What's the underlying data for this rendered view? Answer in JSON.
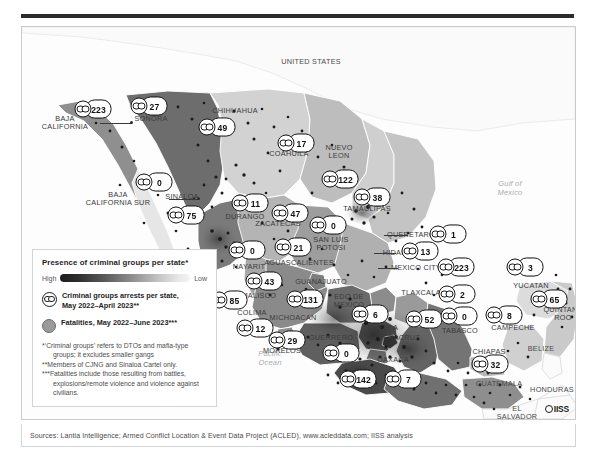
{
  "figure": {
    "ocean_labels": [
      {
        "name": "gulf-of-mexico",
        "text": "Gulf of\nMexico",
        "x": 487,
        "y": 185
      },
      {
        "name": "pacific-ocean",
        "text": "Pacific\nOcean",
        "x": 248,
        "y": 355
      }
    ],
    "geo_labels": [
      {
        "name": "united-states",
        "text": "UNITED STATES",
        "x": 310,
        "y": 61,
        "cls": "country"
      },
      {
        "name": "baja-california",
        "text": "BAJA\nCALIFORNIA",
        "x": 64,
        "y": 122
      },
      {
        "name": "baja-california-sur",
        "text": "BAJA\nCALIFORNIA SUR",
        "x": 117,
        "y": 198
      },
      {
        "name": "sonora",
        "text": "SONORA",
        "x": 150,
        "y": 118
      },
      {
        "name": "chihuahua",
        "text": "CHIHUAHUA",
        "x": 234,
        "y": 110
      },
      {
        "name": "coahuila",
        "text": "COAHUILA",
        "x": 288,
        "y": 153
      },
      {
        "name": "nuevo-leon",
        "text": "NUEVO\nLEON",
        "x": 338,
        "y": 151
      },
      {
        "name": "tamaulipas",
        "text": "TAMAULIPAS",
        "x": 366,
        "y": 208
      },
      {
        "name": "sinaloa",
        "text": "SINALOA",
        "x": 181,
        "y": 196
      },
      {
        "name": "durango",
        "text": "DURANGO",
        "x": 244,
        "y": 216
      },
      {
        "name": "zacatecas",
        "text": "ZACATECAS",
        "x": 277,
        "y": 223
      },
      {
        "name": "san-luis-potosi",
        "text": "SAN LUIS\nPOTOSI",
        "x": 330,
        "y": 243
      },
      {
        "name": "nayarit",
        "text": "NAYARIT",
        "x": 248,
        "y": 266
      },
      {
        "name": "aguascalientes",
        "text": "AGUASCALIENTES",
        "x": 298,
        "y": 262
      },
      {
        "name": "guanajuato",
        "text": "GUANAJUATO",
        "x": 320,
        "y": 281
      },
      {
        "name": "jalisco",
        "text": "JALISCO",
        "x": 259,
        "y": 295
      },
      {
        "name": "colima",
        "text": "COLIMA",
        "x": 251,
        "y": 312
      },
      {
        "name": "michoacan",
        "text": "MICHOACAN",
        "x": 292,
        "y": 317
      },
      {
        "name": "estado-de-mexico",
        "text": "EDO DE\nMEXICO",
        "x": 348,
        "y": 300
      },
      {
        "name": "morelos",
        "text": "MORELOS",
        "x": 281,
        "y": 350
      },
      {
        "name": "guerrero",
        "text": "GUERRERO",
        "x": 330,
        "y": 337
      },
      {
        "name": "queretaro",
        "text": "QUERETARO",
        "x": 410,
        "y": 234
      },
      {
        "name": "hidalgo",
        "text": "HIDALGO",
        "x": 399,
        "y": 252
      },
      {
        "name": "mexico-city",
        "text": "MEXICO CITY",
        "x": 415,
        "y": 267
      },
      {
        "name": "tlaxcala",
        "text": "TLAXCALA",
        "x": 420,
        "y": 292
      },
      {
        "name": "puebla",
        "text": "PUEBLA",
        "x": 382,
        "y": 327
      },
      {
        "name": "veracruz",
        "text": "VERACRUZ",
        "x": 398,
        "y": 337
      },
      {
        "name": "oaxaca",
        "text": "OAXACA",
        "x": 392,
        "y": 359
      },
      {
        "name": "tabasco",
        "text": "TABASCO",
        "x": 459,
        "y": 330
      },
      {
        "name": "campeche",
        "text": "CAMPECHE",
        "x": 512,
        "y": 327
      },
      {
        "name": "yucatan",
        "text": "YUCATAN",
        "x": 530,
        "y": 285
      },
      {
        "name": "quintana-roo",
        "text": "QUINTANA\nROO",
        "x": 562,
        "y": 313
      },
      {
        "name": "chiapas",
        "text": "CHIAPAS",
        "x": 488,
        "y": 351
      },
      {
        "name": "belize",
        "text": "BELIZE",
        "x": 540,
        "y": 348,
        "cls": "country"
      },
      {
        "name": "guatemala",
        "text": "GUATEMALA",
        "x": 498,
        "y": 383,
        "cls": "country"
      },
      {
        "name": "honduras",
        "text": "HONDURAS",
        "x": 551,
        "y": 389,
        "cls": "country"
      },
      {
        "name": "el-salvador",
        "text": "EL\nSALVADOR",
        "x": 516,
        "y": 412,
        "cls": "country"
      }
    ],
    "markers": [
      {
        "name": "marker-baja-california",
        "state": "Baja California",
        "value": "223",
        "x": 92,
        "y": 108
      },
      {
        "name": "marker-sonora",
        "state": "Sonora",
        "value": "27",
        "x": 148,
        "y": 105
      },
      {
        "name": "marker-chihuahua",
        "state": "Chihuahua",
        "value": "49",
        "x": 216,
        "y": 126
      },
      {
        "name": "marker-coahuila",
        "state": "Coahuila",
        "value": "17",
        "x": 295,
        "y": 142
      },
      {
        "name": "marker-nuevo-leon",
        "state": "Nuevo Leon",
        "value": "122",
        "x": 339,
        "y": 178
      },
      {
        "name": "marker-tamaulipas",
        "state": "Tamaulipas",
        "value": "38",
        "x": 371,
        "y": 196
      },
      {
        "name": "marker-baja-california-sur",
        "state": "Baja California Sur",
        "value": "0",
        "x": 153,
        "y": 181
      },
      {
        "name": "marker-sinaloa",
        "state": "Sinaloa",
        "value": "75",
        "x": 185,
        "y": 214
      },
      {
        "name": "marker-durango",
        "state": "Durango",
        "value": "11",
        "x": 249,
        "y": 202
      },
      {
        "name": "marker-zacatecas",
        "state": "Zacatecas",
        "value": "47",
        "x": 289,
        "y": 212
      },
      {
        "name": "marker-san-luis-potosi",
        "state": "San Luis Potosi",
        "value": "0",
        "x": 327,
        "y": 224
      },
      {
        "name": "marker-nayarit",
        "state": "Nayarit",
        "value": "0",
        "x": 246,
        "y": 249
      },
      {
        "name": "marker-slp-second",
        "state": "Zacatecas south",
        "value": "21",
        "x": 292,
        "y": 246
      },
      {
        "name": "marker-aguascalientes",
        "state": "Aguascalientes",
        "value": "43",
        "x": 263,
        "y": 280
      },
      {
        "name": "marker-jalisco",
        "state": "Jalisco",
        "value": "85",
        "x": 228,
        "y": 299
      },
      {
        "name": "marker-guanajuato",
        "state": "Guanajuato",
        "value": "131",
        "x": 304,
        "y": 298
      },
      {
        "name": "marker-colima",
        "state": "Colima",
        "value": "12",
        "x": 254,
        "y": 327
      },
      {
        "name": "marker-morelos",
        "state": "Morelos",
        "value": "29",
        "x": 286,
        "y": 339
      },
      {
        "name": "marker-guerrero",
        "state": "Guerrero",
        "value": "0",
        "x": 340,
        "y": 352
      },
      {
        "name": "marker-oaxaca-south",
        "state": "Oaxaca south",
        "value": "142",
        "x": 357,
        "y": 378
      },
      {
        "name": "marker-oaxaca",
        "state": "Oaxaca",
        "value": "7",
        "x": 402,
        "y": 378
      },
      {
        "name": "marker-queretaro",
        "state": "Queretaro",
        "value": "1",
        "x": 447,
        "y": 233
      },
      {
        "name": "marker-hidalgo",
        "state": "Hidalgo",
        "value": "13",
        "x": 419,
        "y": 250
      },
      {
        "name": "marker-mexico-city",
        "state": "Mexico City",
        "value": "223",
        "x": 455,
        "y": 266
      },
      {
        "name": "marker-tlaxcala",
        "state": "Tlaxcala",
        "value": "2",
        "x": 456,
        "y": 293
      },
      {
        "name": "marker-puebla",
        "state": "Puebla",
        "value": "6",
        "x": 369,
        "y": 313
      },
      {
        "name": "marker-veracruz",
        "state": "Veracruz",
        "value": "52",
        "x": 423,
        "y": 318
      },
      {
        "name": "marker-tabasco",
        "state": "Tabasco",
        "value": "0",
        "x": 458,
        "y": 315
      },
      {
        "name": "marker-campeche",
        "state": "Campeche",
        "value": "8",
        "x": 503,
        "y": 314
      },
      {
        "name": "marker-yucatan",
        "state": "Yucatan",
        "value": "3",
        "x": 524,
        "y": 266
      },
      {
        "name": "marker-quintana-roo",
        "state": "Quintana Roo",
        "value": "65",
        "x": 548,
        "y": 298
      },
      {
        "name": "marker-chiapas",
        "state": "Chiapas",
        "value": "32",
        "x": 489,
        "y": 363
      }
    ]
  },
  "legend": {
    "title": "Presence of criminal groups per state*",
    "ramp_high": "High",
    "ramp_low": "Low",
    "arrests_label": "Criminal groups arrests per state,\nMay 2022–April 2023**",
    "fatalities_label": "Fatalities, May 2022–June 2023***",
    "footnote_1": "*‘Criminal groups’ refers to DTOs and mafia-type groups; it excludes smaller gangs",
    "footnote_2": "**Members of CJNG and Sinaloa Cartel only.",
    "footnote_3": "***Fatalities include those resulting from battles, explosions/remote violence and violence against civilians."
  },
  "sources": {
    "text": "Sources: Lantia Intelligence; Armed Conflict Location & Event Data Project (ACLED), www.acleddata.com; IISS analysis"
  },
  "branding": {
    "logo_text": "IISS"
  },
  "colors": {
    "ramp_dark": "#1c1c1c",
    "ramp_light": "#f4f4f4",
    "fatality_dot": "#9a9a9a",
    "frame": "#d2d5d7",
    "text": "#1d1d1d"
  }
}
